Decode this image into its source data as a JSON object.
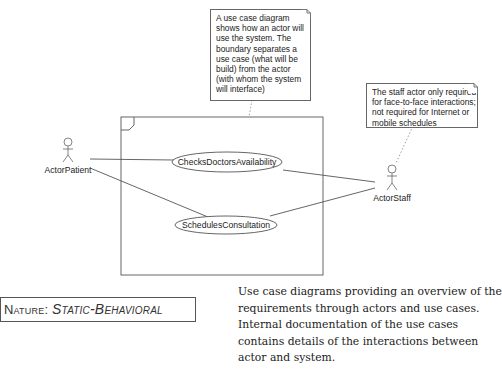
{
  "diagram": {
    "type": "UML use case diagram",
    "actors": [
      {
        "id": "patient",
        "label": "ActorPatient"
      },
      {
        "id": "staff",
        "label": "ActorStaff"
      }
    ],
    "use_cases": [
      {
        "id": "checks",
        "label": "ChecksDoctorsAvailability"
      },
      {
        "id": "schedules",
        "label": "SchedulesConsultation"
      }
    ],
    "notes": [
      {
        "id": "boundary-note",
        "lines": [
          "A use case diagram",
          "shows how an actor will",
          "use the system. The",
          "boundary separates a",
          "use case (what will be",
          "build) from the actor",
          "(with whom the system",
          "will interface)"
        ]
      },
      {
        "id": "staff-note",
        "lines": [
          "The staff actor only required",
          "for face-to-face interactions;",
          "not required for Internet or",
          "mobile schedules"
        ]
      }
    ]
  },
  "nature": {
    "label": "Nature: ",
    "value": "Static-Behavioral"
  },
  "description": "Use case diagrams providing an overview of the requirements through actors and use cases. Internal documentation of the use cases contains details of the interactions between actor and system.",
  "colors": {
    "line": "#555555",
    "text": "#222222",
    "background": "#ffffff"
  }
}
